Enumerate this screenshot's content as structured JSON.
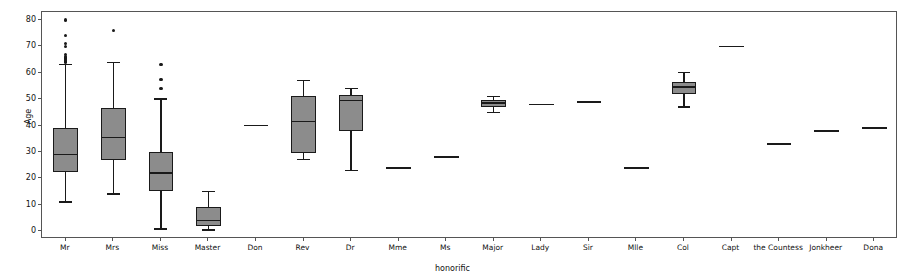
{
  "chart_data": {
    "type": "box",
    "title": "",
    "xlabel": "honorific",
    "ylabel": "Age",
    "ylim": [
      -3,
      83
    ],
    "yticks": [
      0,
      10,
      20,
      30,
      40,
      50,
      60,
      70,
      80
    ],
    "grid": false,
    "legend": null,
    "box_color": "#8c8c8c",
    "line_color": "#1a1a1a",
    "categories": [
      "Mr",
      "Mrs",
      "Miss",
      "Master",
      "Don",
      "Rev",
      "Dr",
      "Mme",
      "Ms",
      "Major",
      "Lady",
      "Sir",
      "Mlle",
      "Col",
      "Capt",
      "the Countess",
      "Jonkheer",
      "Dona"
    ],
    "boxes": [
      {
        "category": "Mr",
        "whisker_low": 11,
        "q1": 22.5,
        "median": 29,
        "q3": 39,
        "whisker_high": 63,
        "fliers": [
          80,
          74,
          71,
          70,
          67,
          66,
          65.5,
          65,
          64.5,
          64
        ]
      },
      {
        "category": "Mrs",
        "whisker_low": 14,
        "q1": 27,
        "median": 35.5,
        "q3": 46.5,
        "whisker_high": 64,
        "fliers": [
          76
        ]
      },
      {
        "category": "Miss",
        "whisker_low": 0.75,
        "q1": 15,
        "median": 22,
        "q3": 30,
        "whisker_high": 50,
        "fliers": [
          63,
          57.5,
          54
        ]
      },
      {
        "category": "Master",
        "whisker_low": 0.42,
        "q1": 2,
        "median": 4,
        "q3": 9,
        "whisker_high": 15,
        "fliers": []
      },
      {
        "category": "Don",
        "whisker_low": 40,
        "q1": 40,
        "median": 40,
        "q3": 40,
        "whisker_high": 40,
        "fliers": []
      },
      {
        "category": "Rev",
        "whisker_low": 27,
        "q1": 29.5,
        "median": 41.5,
        "q3": 51,
        "whisker_high": 57,
        "fliers": []
      },
      {
        "category": "Dr",
        "whisker_low": 23,
        "q1": 38,
        "median": 49.5,
        "q3": 51.5,
        "whisker_high": 54,
        "fliers": []
      },
      {
        "category": "Mme",
        "whisker_low": 24,
        "q1": 24,
        "median": 24,
        "q3": 24,
        "whisker_high": 24,
        "fliers": []
      },
      {
        "category": "Ms",
        "whisker_low": 28,
        "q1": 28,
        "median": 28,
        "q3": 28,
        "whisker_high": 28,
        "fliers": []
      },
      {
        "category": "Major",
        "whisker_low": 45,
        "q1": 47,
        "median": 48.5,
        "q3": 49.5,
        "whisker_high": 51,
        "fliers": []
      },
      {
        "category": "Lady",
        "whisker_low": 48,
        "q1": 48,
        "median": 48,
        "q3": 48,
        "whisker_high": 48,
        "fliers": []
      },
      {
        "category": "Sir",
        "whisker_low": 49,
        "q1": 49,
        "median": 49,
        "q3": 49,
        "whisker_high": 49,
        "fliers": []
      },
      {
        "category": "Mlle",
        "whisker_low": 24,
        "q1": 24,
        "median": 24,
        "q3": 24,
        "whisker_high": 24,
        "fliers": []
      },
      {
        "category": "Col",
        "whisker_low": 47,
        "q1": 52,
        "median": 54.5,
        "q3": 56.5,
        "whisker_high": 60,
        "fliers": []
      },
      {
        "category": "Capt",
        "whisker_low": 70,
        "q1": 70,
        "median": 70,
        "q3": 70,
        "whisker_high": 70,
        "fliers": []
      },
      {
        "category": "the Countess",
        "whisker_low": 33,
        "q1": 33,
        "median": 33,
        "q3": 33,
        "whisker_high": 33,
        "fliers": []
      },
      {
        "category": "Jonkheer",
        "whisker_low": 38,
        "q1": 38,
        "median": 38,
        "q3": 38,
        "whisker_high": 38,
        "fliers": []
      },
      {
        "category": "Dona",
        "whisker_low": 39,
        "q1": 39,
        "median": 39,
        "q3": 39,
        "whisker_high": 39,
        "fliers": []
      }
    ]
  }
}
